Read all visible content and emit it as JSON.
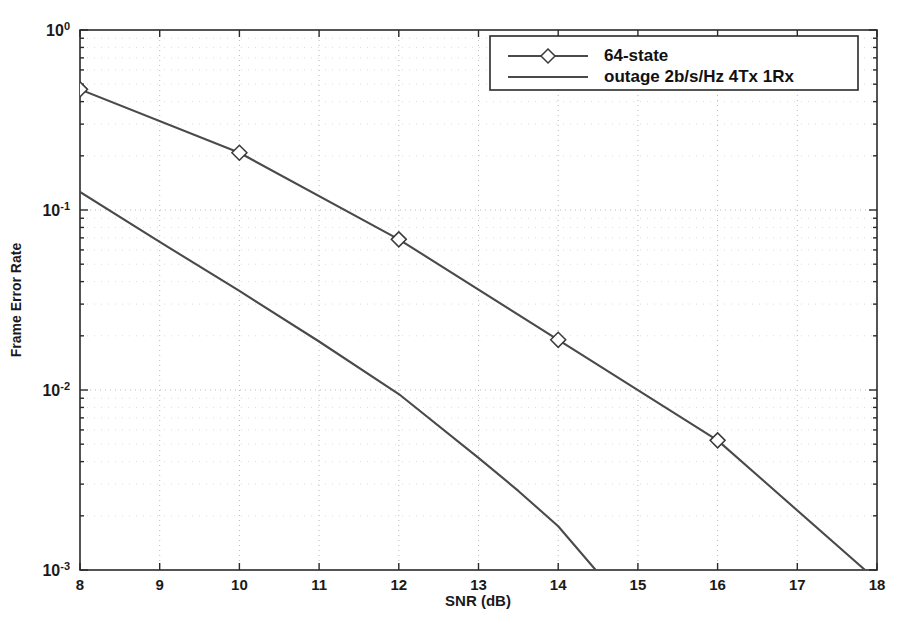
{
  "chart_data": {
    "type": "line",
    "title": "",
    "xlabel": "SNR (dB)",
    "ylabel": "Frame Error Rate",
    "xlim": [
      8,
      18
    ],
    "ylim": [
      0.001,
      1
    ],
    "yscale": "log",
    "xscale": "linear",
    "grid": true,
    "grid_style": "dotted",
    "legend_position": "top-right",
    "xticks": [
      8,
      9,
      10,
      11,
      12,
      13,
      14,
      15,
      16,
      17,
      18
    ],
    "xtick_labels": [
      "8",
      "9",
      "10",
      "11",
      "12",
      "13",
      "14",
      "15",
      "16",
      "17",
      "18"
    ],
    "yticks": [
      1,
      0.1,
      0.01,
      0.001
    ],
    "ytick_labels": [
      {
        "mantissa": "10",
        "exponent": "0"
      },
      {
        "mantissa": "10",
        "exponent": "-1"
      },
      {
        "mantissa": "10",
        "exponent": "-2"
      },
      {
        "mantissa": "10",
        "exponent": "-3"
      }
    ],
    "series": [
      {
        "name": "64-state",
        "marker": "diamond",
        "color": "#4a4a4a",
        "x": [
          8,
          10,
          12,
          14,
          16,
          17.85
        ],
        "y": [
          0.468,
          0.208,
          0.0687,
          0.019,
          0.00525,
          0.001
        ],
        "marker_x": [
          8,
          10,
          12,
          14,
          16
        ],
        "marker_y": [
          0.468,
          0.208,
          0.0687,
          0.019,
          0.00525
        ]
      },
      {
        "name": "outage 2b/s/Hz 4Tx 1Rx",
        "marker": "none",
        "color": "#4a4a4a",
        "x": [
          8,
          9,
          10,
          11,
          12,
          13,
          13.5,
          14,
          14.47
        ],
        "y": [
          0.126,
          0.0665,
          0.0355,
          0.0186,
          0.0095,
          0.0042,
          0.00275,
          0.00175,
          0.001
        ]
      }
    ]
  },
  "legend": {
    "entries": [
      {
        "label": "64-state",
        "marker": "diamond"
      },
      {
        "label": "outage 2b/s/Hz 4Tx 1Rx",
        "marker": "none"
      }
    ]
  },
  "axes": {
    "xlabel": "SNR (dB)",
    "ylabel": "Frame Error Rate"
  }
}
